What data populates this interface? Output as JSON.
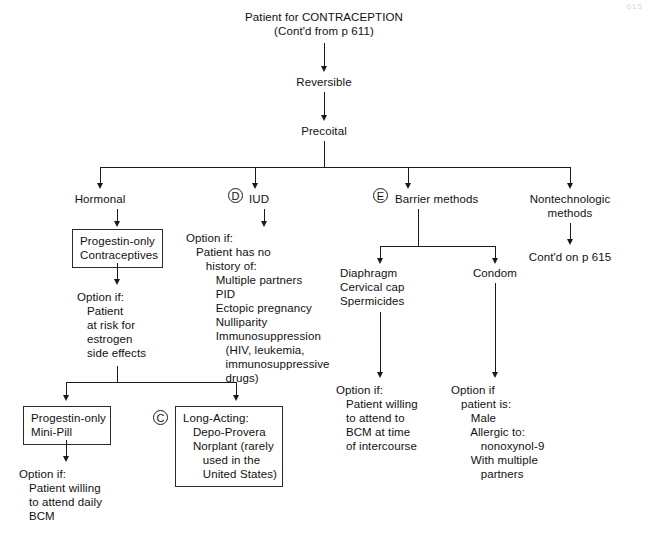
{
  "figure": {
    "page_mark": "615",
    "root": {
      "line1": "Patient for CONTRACEPTION",
      "line2": "(Cont'd from p 611)"
    },
    "spine": [
      {
        "label": "Reversible"
      },
      {
        "label": "Precoital"
      }
    ],
    "branches": [
      {
        "id": "hormonal",
        "label": "Hormonal",
        "marker": ""
      },
      {
        "id": "iud",
        "label": "IUD",
        "marker": "D"
      },
      {
        "id": "barrier",
        "label": "Barrier methods",
        "marker": "E"
      },
      {
        "id": "nontech",
        "label": "Nontechnologic\nmethods",
        "marker": ""
      }
    ],
    "hormonal": {
      "box": "Progestin-only\nContraceptives",
      "option": "Option if:\n   Patient\n   at risk for\n   estrogen\n   side effects",
      "children": [
        {
          "id": "mini-pill",
          "marker": "",
          "box": "Progestin-only\nMini-Pill",
          "option": "Option if:\n   Patient willing\n   to attend daily\n   BCM"
        },
        {
          "id": "long-acting",
          "marker": "C",
          "box": "Long-Acting:\n   Depo-Provera\n   Norplant (rarely\n      used in the\n      United States)",
          "option": ""
        }
      ]
    },
    "iud": {
      "option": "Option if:\n   Patient has no\n      history of:\n         Multiple partners\n         PID\n         Ectopic pregnancy\n         Nulliparity\n         Immunosuppression\n            (HIV, leukemia,\n            immunosuppressive\n            drugs)"
    },
    "barrier": {
      "children": [
        {
          "id": "diaphragm",
          "label": "Diaphragm\nCervical cap\nSpermicides",
          "option": "Option if:\n   Patient willing\n   to attend to\n   BCM at time\n   of intercourse"
        },
        {
          "id": "condom",
          "label": "Condom",
          "option": "Option if\n   patient is:\n      Male\n      Allergic to:\n         nonoxynol-9\n      With multiple\n         partners"
        }
      ]
    },
    "nontech": {
      "continuation": "Cont'd on p 615"
    }
  }
}
